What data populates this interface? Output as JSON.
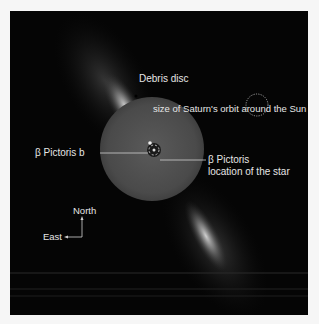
{
  "image": {
    "description": "Beta Pictoris debris disc image with coronagraph mask",
    "background_color": "#050505",
    "page_background": "#f6f6f6",
    "label_color": "#e6e6e6"
  },
  "labels": {
    "debris_disc": "Debris disc",
    "saturn_orbit": "size of Saturn's orbit around the Sun",
    "planet": "β Pictoris b",
    "star_line1": "β Pictoris",
    "star_line2": "location of the star",
    "north": "North",
    "east": "East"
  },
  "icons": {
    "saturn_orbit_marker": "dotted-circle-icon",
    "compass": "compass-arrows-icon"
  }
}
